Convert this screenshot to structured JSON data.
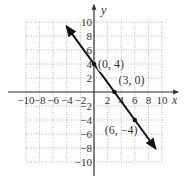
{
  "chart_data": {
    "type": "line",
    "title": "",
    "xlabel": "x",
    "ylabel": "y",
    "xlim": [
      -10,
      10
    ],
    "ylim": [
      -10,
      10
    ],
    "grid": true,
    "x_ticks": [
      -10,
      -8,
      -6,
      -4,
      -2,
      2,
      4,
      6,
      8,
      10
    ],
    "y_ticks": [
      10,
      8,
      6,
      4,
      2,
      -2,
      -4,
      -6,
      -8,
      -10
    ],
    "x_tick_labels": [
      "-10",
      "-8",
      "-6",
      "-4",
      "-2",
      "2",
      "4",
      "6",
      "8",
      "10"
    ],
    "y_tick_labels": [
      "10",
      "8",
      "6",
      "4",
      "2",
      "-2",
      "-4",
      "-6",
      "-8",
      "-10"
    ],
    "series": [
      {
        "name": "line",
        "equation": "y = -4/3 x + 4",
        "x": [
          -4,
          9
        ],
        "y": [
          9.33,
          -8
        ],
        "arrows": "both"
      }
    ],
    "points": [
      {
        "x": 0,
        "y": 4,
        "label": "(0, 4)"
      },
      {
        "x": 3,
        "y": 0,
        "label": "(3, 0)"
      },
      {
        "x": 6,
        "y": -4,
        "label": "(6, −4)"
      }
    ],
    "colors": {
      "line": "#111111",
      "grid": "#888888",
      "axis": "#333333"
    }
  }
}
